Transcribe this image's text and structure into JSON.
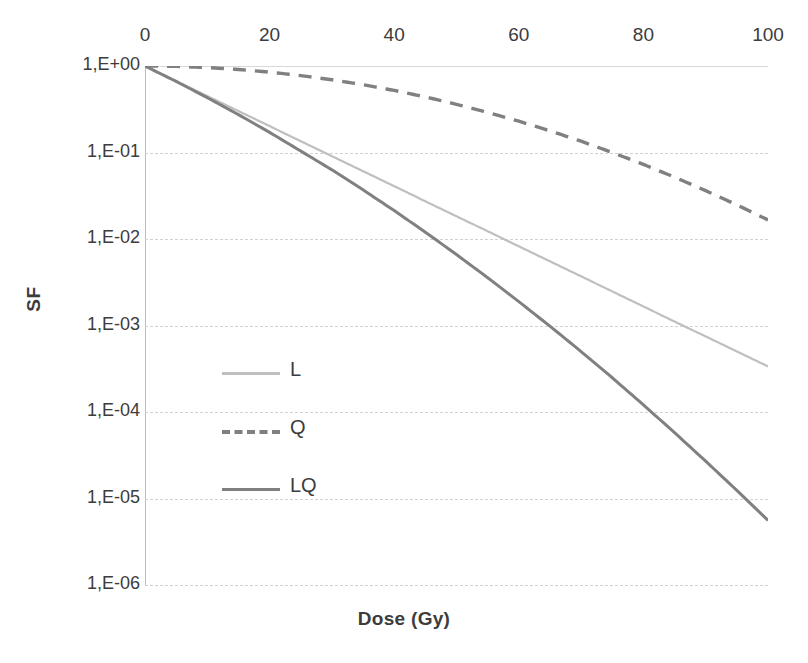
{
  "chart_data": {
    "type": "line",
    "title": "",
    "xlabel": "Dose (Gy)",
    "ylabel": "SF",
    "xlim": [
      0,
      100
    ],
    "ylim": [
      1e-06,
      1
    ],
    "yscale": "log",
    "grid": true,
    "x_axis_position": "top",
    "legend_position": "inside-left",
    "xticks": [
      0,
      20,
      40,
      60,
      80,
      100
    ],
    "xticklabels": [
      "0",
      "20",
      "40",
      "60",
      "80",
      "100"
    ],
    "yticks": [
      1,
      0.1,
      0.01,
      0.001,
      0.0001,
      1e-05,
      1e-06
    ],
    "yticklabels": [
      "1,E+00",
      "1,E-01",
      "1,E-02",
      "1,E-03",
      "1,E-04",
      "1,E-05",
      "1,E-06"
    ],
    "x": [
      0,
      5,
      10,
      15,
      20,
      25,
      30,
      35,
      40,
      45,
      50,
      55,
      60,
      65,
      70,
      75,
      80,
      85,
      90,
      95,
      100
    ],
    "series": [
      {
        "name": "L",
        "style": "solid",
        "color": "#bfbfbf",
        "width": 2.2,
        "values": [
          1,
          0.67,
          0.449,
          0.301,
          0.202,
          0.135,
          0.0907,
          0.0608,
          0.0408,
          0.0273,
          0.0183,
          0.0123,
          0.00823,
          0.00552,
          0.0037,
          0.00248,
          0.00166,
          0.00111,
          0.000747,
          0.000501,
          0.000336
        ]
      },
      {
        "name": "Q",
        "style": "dashed",
        "color": "#808080",
        "width": 3.4,
        "values": [
          1,
          0.99,
          0.96,
          0.912,
          0.849,
          0.775,
          0.694,
          0.608,
          0.522,
          0.439,
          0.361,
          0.291,
          0.23,
          0.178,
          0.135,
          0.1,
          0.0728,
          0.0519,
          0.0362,
          0.0248,
          0.0166
        ]
      },
      {
        "name": "LQ",
        "style": "solid",
        "color": "#808080",
        "width": 3.0,
        "values": [
          1,
          0.663,
          0.431,
          0.274,
          0.171,
          0.104,
          0.063,
          0.037,
          0.0213,
          0.012,
          0.00661,
          0.00357,
          0.00189,
          0.000982,
          0.0005,
          0.000249,
          0.000121,
          5.77e-05,
          2.7e-05,
          1.24e-05,
          5.58e-06
        ]
      }
    ],
    "legend_entries": [
      {
        "label": "L",
        "style": "solid",
        "color": "#bfbfbf"
      },
      {
        "label": "Q",
        "style": "dashed",
        "color": "#808080"
      },
      {
        "label": "LQ",
        "style": "solid",
        "color": "#808080"
      }
    ]
  }
}
